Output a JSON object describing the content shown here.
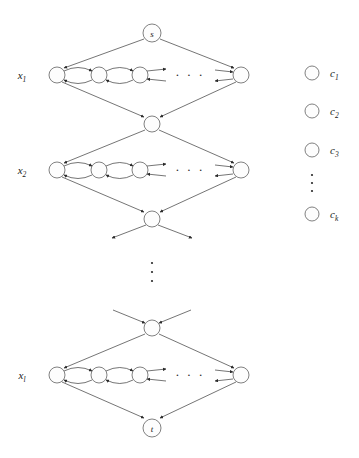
{
  "figure": {
    "type": "graph-diagram",
    "title": "",
    "background_color": "#ffffff",
    "stroke_color": "#3a3a3a",
    "node_fill_color": "#fdfdfd"
  },
  "terminals": {
    "source_label": "s",
    "sink_label": "t"
  },
  "variable_rows": [
    {
      "label": "x",
      "subscript": "1"
    },
    {
      "label": "x",
      "subscript": "2"
    },
    {
      "label": "x",
      "subscript": "l"
    }
  ],
  "clause_nodes": [
    {
      "label": "c",
      "subscript": "1"
    },
    {
      "label": "c",
      "subscript": "2"
    },
    {
      "label": "c",
      "subscript": "3"
    },
    {
      "label": "c",
      "subscript": "k"
    }
  ],
  "ellipses": {
    "horizontal": "· · ·",
    "vertical_dot_count": 3
  },
  "chain": {
    "visible_nodes_per_row": 3,
    "terminal_node_per_row": 1,
    "bidirectional": true
  },
  "junctions": {
    "count": 2,
    "description": "diamond joining nodes between variable rows"
  }
}
